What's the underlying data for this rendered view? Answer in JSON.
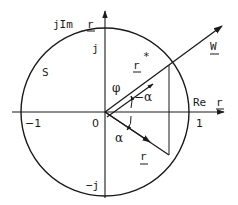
{
  "diagram": {
    "type": "complex-plane-unit-circle",
    "axes": {
      "imaginary_label": "jIm",
      "imaginary_var": "r",
      "real_label": "Re",
      "real_var": "r"
    },
    "ticks": {
      "origin": "0",
      "pos_real": "1",
      "neg_real": "−1",
      "pos_imag": "j",
      "neg_imag": "−j"
    },
    "region_label": "S",
    "vectors": {
      "W": "W",
      "r_star": "r",
      "r_star_sup": "*",
      "r": "r"
    },
    "angles": {
      "phi": "φ",
      "neg_alpha": "−α",
      "alpha": "α"
    },
    "colors": {
      "ink": "#1a1a1a",
      "background": "#ffffff"
    }
  }
}
